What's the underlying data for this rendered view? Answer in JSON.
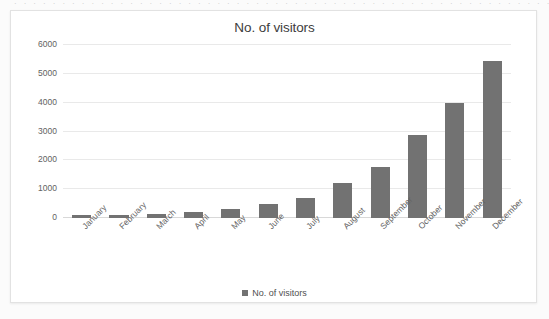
{
  "top_sliver_text": "· · · · · · · · · · · · · · · · · · · · · · · · · · · · · · · · · · · · · · · · · · · · · · · · · · · · · · · · · · · · · · · · · · · · · · · · · · ·",
  "chart": {
    "title": "No. of visitors",
    "legend": {
      "label": "No. of visitors",
      "swatch_icon": "square-swatch-icon",
      "position": "bottom-center"
    }
  },
  "colors": {
    "bar": "#727272",
    "gridline": "#e9e9e9",
    "baseline": "#d8d8d8",
    "panel_background": "#ffffff",
    "panel_border": "#e2e2e2",
    "page_background": "#fbfbfb",
    "title_text": "#3d3d3d",
    "tick_text": "#626262"
  },
  "chart_data": {
    "type": "bar",
    "title": "No. of visitors",
    "xlabel": "",
    "ylabel": "",
    "ylim": [
      0,
      6000
    ],
    "yticks": [
      0,
      1000,
      2000,
      3000,
      4000,
      5000,
      6000
    ],
    "ytick_labels": [
      "0",
      "1000",
      "2000",
      "3000",
      "4000",
      "5000",
      "6000"
    ],
    "grid": true,
    "legend_position": "bottom-center",
    "categories": [
      "January",
      "February",
      "March",
      "April",
      "May",
      "June",
      "July",
      "August",
      "September",
      "October",
      "November",
      "December"
    ],
    "series": [
      {
        "name": "No. of visitors",
        "color": "#727272",
        "values": [
          100,
          110,
          150,
          210,
          310,
          470,
          690,
          1200,
          1760,
          2880,
          4000,
          5450
        ]
      }
    ]
  }
}
